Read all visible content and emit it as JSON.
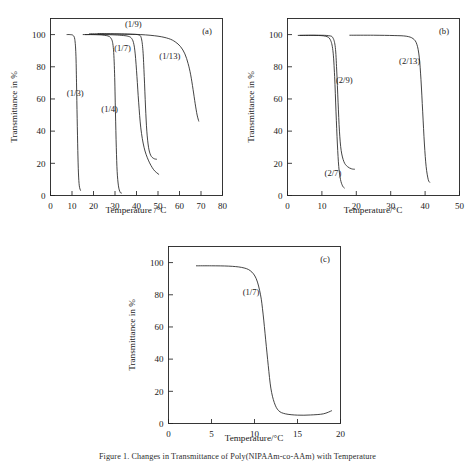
{
  "figure": {
    "caption": "Figure 1.  Changes in Transmittance of Poly(NIPAAm-co-AAm) with Temperature",
    "axis_titles": {
      "x": "Temperature /°C",
      "x_alt": "Temperature/°C",
      "y": "Transmittance in %"
    }
  },
  "chart_data": [
    {
      "type": "line",
      "panel": "(a)",
      "title": "",
      "xlabel": "Temperature /°C",
      "ylabel": "Transmittance in %",
      "xlim": [
        0,
        80
      ],
      "ylim": [
        0,
        110
      ],
      "xticks": [
        0,
        10,
        20,
        30,
        40,
        50,
        60,
        70,
        80
      ],
      "yticks": [
        0,
        20,
        40,
        60,
        80,
        100
      ],
      "grid": false,
      "legend": "inline-annotations",
      "series": [
        {
          "name": "(1/3)",
          "label_xy": [
            11.5,
            62
          ],
          "x": [
            7.5,
            9,
            10.5,
            11.3,
            11.8,
            12.1,
            12.4,
            12.7,
            13.0,
            13.4,
            14.0
          ],
          "y": [
            100,
            100,
            99.5,
            97,
            88,
            70,
            48,
            28,
            14,
            6,
            3
          ]
        },
        {
          "name": "(1/4)",
          "label_xy": [
            27.5,
            52
          ],
          "x": [
            15,
            20,
            25,
            28,
            29.2,
            29.8,
            30.2,
            30.6,
            31.0,
            31.6,
            32.4,
            33.2
          ],
          "y": [
            100,
            100,
            99.6,
            98,
            92,
            76,
            52,
            30,
            15,
            6,
            2,
            1.5
          ]
        },
        {
          "name": "(1/7)",
          "label_xy": [
            33.5,
            90
          ],
          "x": [
            16,
            24,
            30,
            34,
            36,
            37.5,
            38.6,
            39.4,
            40.2,
            41.0,
            42.0,
            43.5,
            45.5,
            48.0,
            50.5
          ],
          "y": [
            100,
            100,
            99.8,
            99.4,
            99,
            98,
            95,
            88,
            74,
            58,
            42,
            30,
            22,
            16,
            13
          ]
        },
        {
          "name": "(1/9)",
          "label_xy": [
            38.5,
            105
          ],
          "x": [
            18,
            26,
            33,
            38,
            41,
            42.2,
            43.0,
            43.6,
            44.2,
            44.8,
            45.6,
            46.6,
            48.0,
            49.5
          ],
          "y": [
            100.5,
            100.5,
            100.4,
            100.2,
            99.8,
            98,
            90,
            74,
            55,
            40,
            30,
            25,
            23,
            22.5
          ]
        },
        {
          "name": "(1/13)",
          "label_xy": [
            55.5,
            85
          ],
          "x": [
            22,
            32,
            42,
            50,
            55,
            58,
            60.5,
            62.5,
            64,
            65.2,
            66.3,
            67.3,
            68.2,
            69.0
          ],
          "y": [
            100.5,
            100.3,
            100,
            99,
            97.5,
            95.5,
            92.5,
            88,
            82,
            75,
            66,
            57,
            50,
            46
          ]
        }
      ]
    },
    {
      "type": "line",
      "panel": "(b)",
      "title": "",
      "xlabel": "Temperature/°C",
      "ylabel": "Transmittance in %",
      "xlim": [
        0,
        50
      ],
      "ylim": [
        0,
        110
      ],
      "xticks": [
        0,
        10,
        20,
        30,
        40,
        50
      ],
      "yticks": [
        0,
        20,
        40,
        60,
        80,
        100
      ],
      "grid": false,
      "legend": "inline-annotations",
      "series": [
        {
          "name": "(2/7)",
          "label_xy": [
            13.2,
            12
          ],
          "x": [
            3,
            8,
            11,
            12.4,
            13.2,
            13.7,
            14.1,
            14.5,
            14.9,
            15.4,
            16.0,
            16.6
          ],
          "y": [
            99.5,
            99.5,
            99,
            97,
            90,
            74,
            52,
            32,
            18,
            10,
            6,
            4.5
          ]
        },
        {
          "name": "(2/9)",
          "label_xy": [
            16.5,
            70
          ],
          "x": [
            3.5,
            9,
            12,
            13.2,
            13.9,
            14.3,
            14.7,
            15.1,
            15.6,
            16.4,
            17.4,
            18.6,
            19.6
          ],
          "y": [
            99.5,
            99.6,
            99.3,
            98,
            92,
            78,
            58,
            40,
            28,
            21,
            18,
            16.6,
            16.3
          ]
        },
        {
          "name": "(2/13)",
          "label_xy": [
            35.5,
            82
          ],
          "x": [
            18,
            25,
            31,
            34.5,
            36.5,
            37.6,
            38.3,
            38.8,
            39.3,
            39.8,
            40.3,
            40.9,
            41.4
          ],
          "y": [
            99.6,
            99.6,
            99.4,
            99,
            97.5,
            94,
            86,
            72,
            52,
            32,
            18,
            10,
            8
          ]
        }
      ]
    },
    {
      "type": "line",
      "panel": "(c)",
      "title": "",
      "xlabel": "Temperature/°C",
      "ylabel": "Transmittance in %",
      "xlim": [
        0,
        20
      ],
      "ylim": [
        0,
        110
      ],
      "xticks": [
        0,
        5,
        10,
        15,
        20
      ],
      "yticks": [
        0,
        20,
        40,
        60,
        80,
        100
      ],
      "grid": false,
      "legend": "inline-annotations",
      "series": [
        {
          "name": "(1/7)",
          "label_xy": [
            9.6,
            80
          ],
          "x": [
            3.2,
            5,
            7,
            8.5,
            9.5,
            10.2,
            10.7,
            11.0,
            11.3,
            11.6,
            11.9,
            12.3,
            12.8,
            13.6,
            15,
            16.5,
            18,
            19
          ],
          "y": [
            98,
            98,
            97.8,
            97,
            95,
            90,
            80,
            68,
            52,
            36,
            22,
            13,
            8,
            6,
            5.2,
            5.3,
            6,
            8
          ]
        }
      ]
    }
  ]
}
